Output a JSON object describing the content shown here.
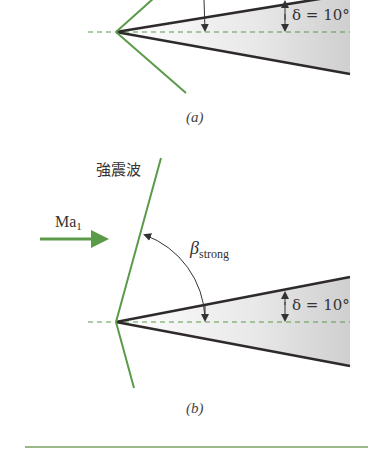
{
  "panel_a": {
    "caption": "(a)",
    "deflection_label": "δ = 10°"
  },
  "panel_b": {
    "caption": "(b)",
    "shock_label": "強震波",
    "flow_label": "Ma",
    "flow_subscript": "1",
    "angle_label": "β",
    "angle_subscript": "strong",
    "deflection_label": "δ = 10°"
  },
  "colors": {
    "shock": "#5a9a48",
    "wedge_edge": "#2e2a2a",
    "wedge_fill": "#d8d8d8",
    "centerline": "#5a9a48",
    "rule": "#7aa060"
  }
}
